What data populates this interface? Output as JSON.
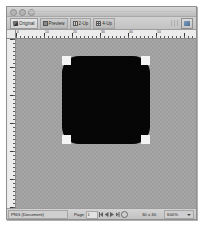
{
  "window": {
    "controls": [
      "close-button",
      "minimize-button",
      "zoom-button"
    ]
  },
  "tabbar": {
    "tabs": [
      {
        "label": "Original",
        "icon": "pencil-icon",
        "active": true
      },
      {
        "label": "Preview",
        "icon": "preview-icon",
        "active": false
      },
      {
        "label": "2-Up",
        "icon": "two-up-icon",
        "active": false
      },
      {
        "label": "4-Up",
        "icon": "four-up-icon",
        "active": false
      }
    ],
    "preview_in_browser_label": "preview-in-browser-icon"
  },
  "rulers": {
    "horizontal_ticks": [
      "0",
      "10",
      "20",
      "30",
      "40",
      "50"
    ],
    "unit": "px"
  },
  "canvas": {
    "artwork_name": "black-rounded-square",
    "artwork_color": "#060606",
    "corner_color": "#f4f4f4",
    "background_color": "#9d9d9d"
  },
  "statusbar": {
    "format": "PNG (Document)",
    "page_label": "Page",
    "page_value": "1",
    "nav": [
      "first-page",
      "previous-page",
      "next-page",
      "last-page"
    ],
    "stop_label": "stop-icon",
    "image_size": "30 x 30",
    "zoom": "600%"
  }
}
